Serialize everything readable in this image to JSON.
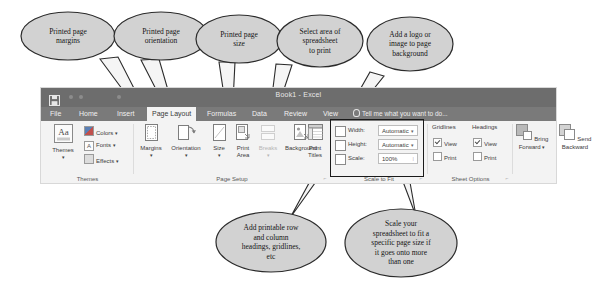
{
  "app": {
    "title": "Book1 - Excel",
    "save_icon": "save-icon",
    "tell_me": "Tell me what you want to do...",
    "tabs": [
      {
        "label": "File",
        "active": false
      },
      {
        "label": "Home",
        "active": false
      },
      {
        "label": "Insert",
        "active": false
      },
      {
        "label": "Page Layout",
        "active": true
      },
      {
        "label": "Formulas",
        "active": false
      },
      {
        "label": "Data",
        "active": false
      },
      {
        "label": "Review",
        "active": false
      },
      {
        "label": "View",
        "active": false
      }
    ]
  },
  "ribbon": {
    "groups": {
      "themes": {
        "label": "Themes",
        "themes_button": "Themes",
        "colors": "Colors",
        "fonts": "Fonts",
        "effects": "Effects",
        "caret": "▾"
      },
      "page_setup": {
        "label": "Page Setup",
        "margins": "Margins",
        "orientation": "Orientation",
        "size": "Size",
        "print_area_1": "Print",
        "print_area_2": "Area",
        "breaks": "Breaks",
        "background": "Background",
        "print_titles_1": "Print",
        "print_titles_2": "Titles",
        "caret": "▾",
        "launcher": "⌐"
      },
      "scale_to_fit": {
        "label": "Scale to Fit",
        "width_label": "Width:",
        "width_value": "Automatic",
        "height_label": "Height:",
        "height_value": "Automatic",
        "scale_label": "Scale:",
        "scale_value": "100%",
        "caret": "▾",
        "spinner": "⁞",
        "launcher": "⌐",
        "highlighted": true
      },
      "sheet_options": {
        "label": "Sheet Options",
        "gridlines_header": "Gridlines",
        "headings_header": "Headings",
        "gridlines_view": "View",
        "gridlines_print": "Print",
        "headings_view": "View",
        "headings_print": "Print",
        "gridlines_view_checked": true,
        "gridlines_print_checked": false,
        "headings_view_checked": true,
        "headings_print_checked": false,
        "launcher": "⌐"
      },
      "arrange": {
        "bring_forward_1": "Bring",
        "bring_forward_2": "Forward",
        "send_backward_1": "Send",
        "send_backward_2": "Backward",
        "caret": "▾"
      }
    }
  },
  "callouts": [
    {
      "id": "margins",
      "text": "Printed page\nmargins"
    },
    {
      "id": "orientation",
      "text": "Printed page\norientation"
    },
    {
      "id": "size",
      "text": "Printed page\nsize"
    },
    {
      "id": "print_area",
      "text": "Select area of\nspreadsheet\nto print"
    },
    {
      "id": "background",
      "text": "Add a logo or\nimage to page\nbackground"
    },
    {
      "id": "print_titles",
      "text": "Add printable row\nand column\nheadings, gridlines,\netc"
    },
    {
      "id": "scale",
      "text": "Scale your\nspreadsheet to fit a\nspecific page size if\nit goes onto more\nthan one"
    }
  ],
  "colors": {
    "titlebar": "#6d6d6d",
    "tabbar": "#7a7a7a",
    "ribbon_bg": "#f3f3f3",
    "active_tab_bg": "#f3f3f3",
    "callout_fill": "#d2d2d2",
    "callout_stroke": "#2b2b2b",
    "highlight_border": "#1a1a1a"
  }
}
